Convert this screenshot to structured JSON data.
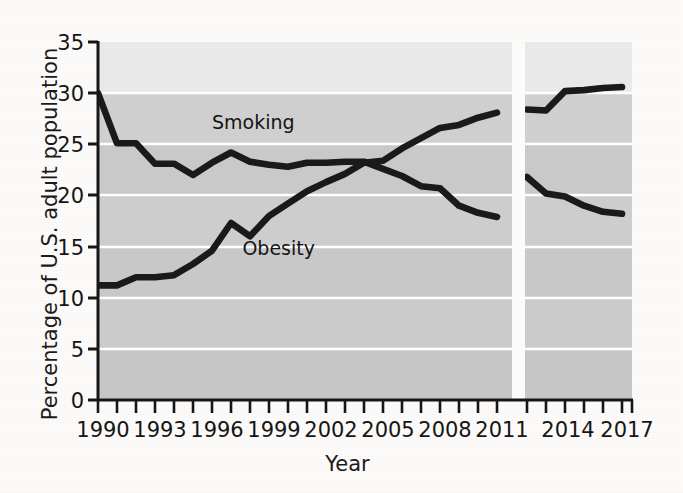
{
  "chart_data": {
    "type": "line",
    "title": "",
    "xlabel": "Year",
    "ylabel": "Percentage of U.S. adult population",
    "xlim": [
      1990,
      2017
    ],
    "ylim": [
      0,
      35
    ],
    "yticks": [
      0,
      5,
      10,
      15,
      20,
      25,
      30,
      35
    ],
    "ytick_labels": [
      "0",
      "5",
      "10",
      "15",
      "20",
      "25",
      "30",
      "35"
    ],
    "xticks": [
      1990,
      1993,
      1996,
      1999,
      2002,
      2005,
      2008,
      2011,
      2014,
      2017
    ],
    "xtick_labels": [
      "1990",
      "1993",
      "1996",
      "1999",
      "2002",
      "2005",
      "2008",
      "2011",
      "2014",
      "2017"
    ],
    "xminor_ticks": [
      1990,
      1991,
      1992,
      1993,
      1994,
      1995,
      1996,
      1997,
      1998,
      1999,
      2000,
      2001,
      2002,
      2003,
      2004,
      2005,
      2006,
      2007,
      2008,
      2009,
      2010,
      2011,
      2012,
      2013,
      2014,
      2015,
      2016,
      2017
    ],
    "grid": "horizontal-white",
    "legend": "inline-annotations",
    "axis_break": {
      "from": 2011,
      "to": 2012,
      "note": "white vertical break band between 2011 and 2012"
    },
    "x": [
      1990,
      1991,
      1992,
      1993,
      1994,
      1995,
      1996,
      1997,
      1998,
      1999,
      2000,
      2001,
      2002,
      2003,
      2004,
      2005,
      2006,
      2007,
      2008,
      2009,
      2010,
      2011,
      2012,
      2013,
      2014,
      2015,
      2016,
      2017
    ],
    "series": [
      {
        "name": "Smoking",
        "color": "#1a1a1a",
        "x": [
          1990,
          1991,
          1992,
          1993,
          1994,
          1995,
          1996,
          1997,
          1998,
          1999,
          2000,
          2001,
          2002,
          2003,
          2004,
          2005,
          2006,
          2007,
          2008,
          2009,
          2010,
          2011
        ],
        "values": [
          30.0,
          25.1,
          25.1,
          23.1,
          23.1,
          22.0,
          23.2,
          24.2,
          23.3,
          23.0,
          22.8,
          23.2,
          23.2,
          23.3,
          23.3,
          22.6,
          21.9,
          20.9,
          20.7,
          19.0,
          18.3,
          17.9
        ],
        "x2": [
          2012,
          2013,
          2014,
          2015,
          2016,
          2017
        ],
        "values2": [
          21.8,
          20.2,
          19.9,
          19.0,
          18.4,
          18.2
        ]
      },
      {
        "name": "Obesity",
        "color": "#1a1a1a",
        "x": [
          1990,
          1991,
          1992,
          1993,
          1994,
          1995,
          1996,
          1997,
          1998,
          1999,
          2000,
          2001,
          2002,
          2003,
          2004,
          2005,
          2006,
          2007,
          2008,
          2009,
          2010,
          2011
        ],
        "values": [
          11.2,
          11.2,
          12.0,
          12.0,
          12.2,
          13.3,
          14.6,
          17.3,
          16.0,
          18.0,
          19.2,
          20.4,
          21.3,
          22.1,
          23.2,
          23.4,
          24.6,
          25.6,
          26.6,
          26.9,
          27.6,
          28.1
        ],
        "x2": [
          2012,
          2013,
          2014,
          2015,
          2016,
          2017
        ],
        "values2": [
          28.4,
          28.3,
          30.2,
          30.3,
          30.5,
          30.6
        ]
      }
    ],
    "annotations": [
      {
        "text": "Smoking",
        "x": 1996.0,
        "y": 26.5
      },
      {
        "text": "Obesity",
        "x": 1997.6,
        "y": 14.2
      }
    ]
  },
  "axes": {
    "y_axis_title": "Percentage of U.S. adult population",
    "x_axis_title": "Year"
  },
  "plot": {
    "background_color": "#cbcbcb",
    "background_color_top_band": "#e7e7e7",
    "gridline_color": "#ffffff",
    "line_color": "#1a1a1a",
    "axis_color": "#161616"
  },
  "annotations": {
    "smoking_label": "Smoking",
    "obesity_label": "Obesity"
  }
}
